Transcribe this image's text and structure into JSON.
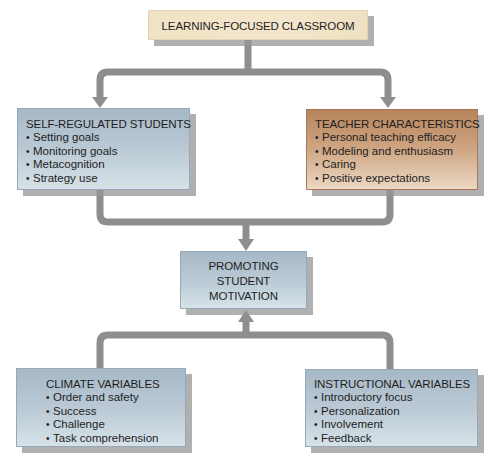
{
  "diagram": {
    "top": {
      "title": "LEARNING-FOCUSED CLASSROOM"
    },
    "self_regulated": {
      "title": "SELF-REGULATED STUDENTS",
      "items": [
        "Setting goals",
        "Monitoring goals",
        "Metacognition",
        "Strategy use"
      ]
    },
    "teacher": {
      "title": "TEACHER CHARACTERISTICS",
      "items": [
        "Personal teaching efficacy",
        "Modeling and enthusiasm",
        "Caring",
        "Positive expectations"
      ]
    },
    "center": {
      "lines": [
        "PROMOTING",
        "STUDENT",
        "MOTIVATION"
      ]
    },
    "climate": {
      "title": "CLIMATE VARIABLES",
      "items": [
        "Order and safety",
        "Success",
        "Challenge",
        "Task comprehension"
      ]
    },
    "instructional": {
      "title": "INSTRUCTIONAL VARIABLES",
      "items": [
        "Introductory focus",
        "Personalization",
        "Involvement",
        "Feedback"
      ]
    }
  },
  "colors": {
    "connector": "#8e8e8e",
    "blue_box": "#b4c4d0",
    "tan_box": "#c9996f",
    "cream_box": "#f2e4c7"
  }
}
